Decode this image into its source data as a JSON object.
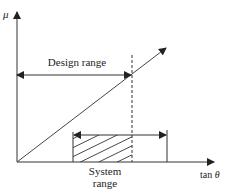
{
  "diagram": {
    "y_axis_label": "μ",
    "x_axis_label_prefix": "tan ",
    "x_axis_label_symbol": "θ",
    "design_range_label": "Design range",
    "system_range_label_line1": "System",
    "system_range_label_line2": "range",
    "colors": {
      "line": "#333333",
      "background": "#ffffff"
    }
  }
}
